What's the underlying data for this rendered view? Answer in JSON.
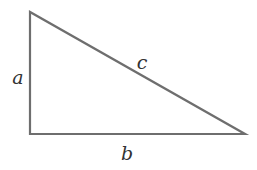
{
  "diagram": {
    "type": "right-triangle",
    "vertices": {
      "top": [
        30,
        12
      ],
      "right_angle": [
        30,
        134
      ],
      "right": [
        245,
        134
      ]
    },
    "labels": {
      "a": "a",
      "b": "b",
      "c": "c"
    },
    "label_positions": {
      "a": [
        18,
        84
      ],
      "b": [
        127,
        160
      ],
      "c": [
        142,
        69
      ]
    },
    "colors": {
      "stroke": "#6e6e6e",
      "label": "#333333",
      "background": "#ffffff"
    }
  }
}
